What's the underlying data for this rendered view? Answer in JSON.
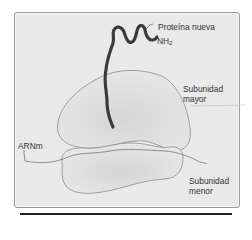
{
  "figure": {
    "labels": {
      "protein": "Proteína nueva",
      "nh2_main": "NH",
      "nh2_sub": "2",
      "major_line1": "Subunidad",
      "major_line2": "mayor",
      "minor_line1": "Subunidad",
      "minor_line2": "menor",
      "mrna": "ARNm"
    },
    "colors": {
      "background": "#e9e9e9",
      "subunit_fill": "#e2e2e2",
      "outline": "#8a8a8a",
      "chain": "#3a3a3a"
    }
  }
}
